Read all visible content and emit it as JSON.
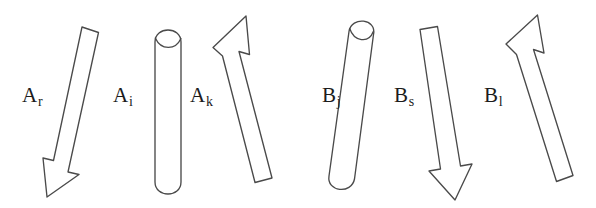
{
  "figure": {
    "background_color": "#ffffff",
    "stroke_color": "#4a4a4a",
    "text_color": "#1c1c1c",
    "width": 596,
    "height": 208,
    "groups": [
      {
        "name": "A",
        "members": [
          "A_r",
          "A_i",
          "A_k"
        ]
      },
      {
        "name": "B",
        "members": [
          "B_j",
          "B_s",
          "B_l"
        ]
      }
    ]
  },
  "labels": [
    {
      "id": "label-a-r",
      "base": "A",
      "sub": "r",
      "x": 22,
      "y": 85
    },
    {
      "id": "label-a-i",
      "base": "A",
      "sub": "i",
      "x": 113,
      "y": 85
    },
    {
      "id": "label-a-k",
      "base": "A",
      "sub": "k",
      "x": 190,
      "y": 85
    },
    {
      "id": "label-b-j",
      "base": "B",
      "sub": "j",
      "x": 322,
      "y": 85
    },
    {
      "id": "label-b-s",
      "base": "B",
      "sub": "s",
      "x": 394,
      "y": 85
    },
    {
      "id": "label-b-l",
      "base": "B",
      "sub": "l",
      "x": 484,
      "y": 85
    }
  ],
  "shapes": [
    {
      "id": "shape-a-r",
      "label": "A_r",
      "kind": "arrow",
      "direction": "down-left",
      "tail_end": "flat",
      "head_end": "arrowhead",
      "outline": "M 82.0 27.0 L 98.5 32.5 L 68.0 172.0 L 79.0 174.5 L 47.0 197.0 L 43.0 158.0 L 53.5 160.5 Z"
    },
    {
      "id": "shape-a-i",
      "label": "A_i",
      "kind": "rod",
      "direction": "vertical",
      "tail_end": "rounded",
      "head_end": "rounded-cap",
      "outline": "M 155.0 42.0 C 155.0 26.0 181.0 26.0 181.0 42.0 L 181.0 182.0 C 181.0 198.0 155.0 198.0 155.0 182.0 Z",
      "cap_arc": "M 155.3 38.0 C 161.0 50.5 175.5 50.5 180.9 38.5"
    },
    {
      "id": "shape-a-k",
      "label": "A_k",
      "kind": "arrow",
      "direction": "up-left",
      "tail_end": "flat",
      "head_end": "arrowhead",
      "outline": "M 213.0 47.5 L 246.0 16.0 L 249.5 54.5 L 239.0 51.5 L 272.0 178.0 L 255.0 182.5 L 222.5 56.0 Z"
    },
    {
      "id": "shape-b-j",
      "label": "B_j",
      "kind": "rod",
      "direction": "near-vertical-tilt",
      "tail_end": "rounded",
      "head_end": "rounded-cap",
      "outline": "M 373.5 34.5 C 377.0 18.5 351.5 16.0 349.0 31.5 L 329.0 176.0 C 326.5 192.0 351.5 194.5 354.5 179.0 Z",
      "cap_arc": "M 349.7 28.5 C 354.0 41.5 368.5 44.0 373.3 31.5"
    },
    {
      "id": "shape-b-s",
      "label": "B_s",
      "kind": "arrow",
      "direction": "down",
      "tail_end": "flat",
      "head_end": "arrowhead",
      "outline": "M 420.0 29.5 L 437.5 26.5 L 460.5 166.0 L 472.0 164.0 L 455.0 200.0 L 429.0 171.0 L 440.5 169.0 Z"
    },
    {
      "id": "shape-b-l",
      "label": "B_l",
      "kind": "arrow",
      "direction": "up-left",
      "tail_end": "flat",
      "head_end": "arrowhead",
      "outline": "M 506.0 44.0 L 537.5 15.0 L 544.0 53.0 L 533.5 49.5 L 573.0 175.5 L 556.5 181.5 L 516.5 54.5 Z"
    }
  ]
}
